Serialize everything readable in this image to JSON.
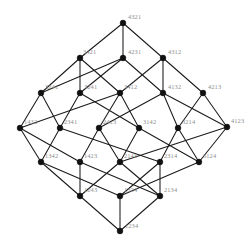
{
  "figure": {
    "type": "hasse-diagram",
    "background_color": "#ffffff",
    "node_color": "#111111",
    "edge_color": "#1a1a1a",
    "label_color": "#8d8d8d"
  },
  "nodes": [
    {
      "id": "n0",
      "label": "4321",
      "x": 123,
      "y": 23,
      "rank": 0,
      "label_dx": 5,
      "label_dy": -5
    },
    {
      "id": "n1",
      "label": "3421",
      "x": 80,
      "y": 58,
      "rank": 1,
      "label_dx": 3,
      "label_dy": -5
    },
    {
      "id": "n2",
      "label": "4231",
      "x": 123,
      "y": 58,
      "rank": 1,
      "label_dx": 5,
      "label_dy": -5
    },
    {
      "id": "n3",
      "label": "4312",
      "x": 163,
      "y": 58,
      "rank": 1,
      "label_dx": 5,
      "label_dy": -5
    },
    {
      "id": "n4",
      "label": "3241",
      "x": 41,
      "y": 93,
      "rank": 2,
      "label_dx": 4,
      "label_dy": -5
    },
    {
      "id": "n5",
      "label": "3241",
      "x": 80,
      "y": 93,
      "rank": 2,
      "label_dx": 4,
      "label_dy": -5
    },
    {
      "id": "n6",
      "label": "3412",
      "x": 120,
      "y": 93,
      "rank": 2,
      "label_dx": 4,
      "label_dy": -5
    },
    {
      "id": "n7",
      "label": "4132",
      "x": 163,
      "y": 93,
      "rank": 2,
      "label_dx": 5,
      "label_dy": -5
    },
    {
      "id": "n8",
      "label": "4213",
      "x": 203,
      "y": 93,
      "rank": 2,
      "label_dx": 5,
      "label_dy": -5
    },
    {
      "id": "n9",
      "label": "1432",
      "x": 20,
      "y": 128,
      "rank": 3,
      "label_dx": 4,
      "label_dy": -5
    },
    {
      "id": "n10",
      "label": "2341",
      "x": 60,
      "y": 128,
      "rank": 3,
      "label_dx": 4,
      "label_dy": -5
    },
    {
      "id": "n11",
      "label": "2413",
      "x": 99,
      "y": 128,
      "rank": 3,
      "label_dx": 4,
      "label_dy": -5
    },
    {
      "id": "n12",
      "label": "3142",
      "x": 139,
      "y": 128,
      "rank": 3,
      "label_dx": 4,
      "label_dy": -5
    },
    {
      "id": "n13",
      "label": "3214",
      "x": 178,
      "y": 128,
      "rank": 3,
      "label_dx": 4,
      "label_dy": -5
    },
    {
      "id": "n14",
      "label": "4123",
      "x": 227,
      "y": 127,
      "rank": 3,
      "label_dx": 4,
      "label_dy": -5
    },
    {
      "id": "n15",
      "label": "1342",
      "x": 41,
      "y": 162,
      "rank": 4,
      "label_dx": 4,
      "label_dy": -5
    },
    {
      "id": "n16",
      "label": "1423",
      "x": 80,
      "y": 162,
      "rank": 4,
      "label_dx": 4,
      "label_dy": -5
    },
    {
      "id": "n17",
      "label": "2143",
      "x": 120,
      "y": 162,
      "rank": 4,
      "label_dx": 4,
      "label_dy": -5
    },
    {
      "id": "n18",
      "label": "2314",
      "x": 160,
      "y": 162,
      "rank": 4,
      "label_dx": 4,
      "label_dy": -5
    },
    {
      "id": "n19",
      "label": "3124",
      "x": 199,
      "y": 162,
      "rank": 4,
      "label_dx": 4,
      "label_dy": -5
    },
    {
      "id": "n20",
      "label": "1243",
      "x": 80,
      "y": 196,
      "rank": 5,
      "label_dx": 4,
      "label_dy": -5
    },
    {
      "id": "n21",
      "label": "1324",
      "x": 120,
      "y": 196,
      "rank": 5,
      "label_dx": 4,
      "label_dy": -5
    },
    {
      "id": "n22",
      "label": "2134",
      "x": 160,
      "y": 196,
      "rank": 5,
      "label_dx": 4,
      "label_dy": -5
    },
    {
      "id": "n23",
      "label": "1234",
      "x": 120,
      "y": 231,
      "rank": 6,
      "label_dx": 5,
      "label_dy": -4
    }
  ],
  "edges": [
    {
      "from": "n0",
      "to": "n1"
    },
    {
      "from": "n0",
      "to": "n2"
    },
    {
      "from": "n0",
      "to": "n3"
    },
    {
      "from": "n1",
      "to": "n4"
    },
    {
      "from": "n1",
      "to": "n5"
    },
    {
      "from": "n1",
      "to": "n6"
    },
    {
      "from": "n2",
      "to": "n5"
    },
    {
      "from": "n2",
      "to": "n7"
    },
    {
      "from": "n2",
      "to": "n4"
    },
    {
      "from": "n3",
      "to": "n6"
    },
    {
      "from": "n3",
      "to": "n7"
    },
    {
      "from": "n3",
      "to": "n8"
    },
    {
      "from": "n4",
      "to": "n9"
    },
    {
      "from": "n4",
      "to": "n10"
    },
    {
      "from": "n5",
      "to": "n10"
    },
    {
      "from": "n5",
      "to": "n12"
    },
    {
      "from": "n6",
      "to": "n9"
    },
    {
      "from": "n6",
      "to": "n11"
    },
    {
      "from": "n6",
      "to": "n12"
    },
    {
      "from": "n7",
      "to": "n11"
    },
    {
      "from": "n7",
      "to": "n13"
    },
    {
      "from": "n7",
      "to": "n14"
    },
    {
      "from": "n8",
      "to": "n13"
    },
    {
      "from": "n8",
      "to": "n14"
    },
    {
      "from": "n9",
      "to": "n15"
    },
    {
      "from": "n9",
      "to": "n16"
    },
    {
      "from": "n10",
      "to": "n15"
    },
    {
      "from": "n10",
      "to": "n18"
    },
    {
      "from": "n11",
      "to": "n16"
    },
    {
      "from": "n11",
      "to": "n17"
    },
    {
      "from": "n12",
      "to": "n17"
    },
    {
      "from": "n12",
      "to": "n19"
    },
    {
      "from": "n13",
      "to": "n18"
    },
    {
      "from": "n13",
      "to": "n19"
    },
    {
      "from": "n14",
      "to": "n17"
    },
    {
      "from": "n14",
      "to": "n19"
    },
    {
      "from": "n15",
      "to": "n20"
    },
    {
      "from": "n15",
      "to": "n21"
    },
    {
      "from": "n16",
      "to": "n20"
    },
    {
      "from": "n16",
      "to": "n22"
    },
    {
      "from": "n17",
      "to": "n20"
    },
    {
      "from": "n17",
      "to": "n22"
    },
    {
      "from": "n18",
      "to": "n21"
    },
    {
      "from": "n18",
      "to": "n22"
    },
    {
      "from": "n19",
      "to": "n21"
    },
    {
      "from": "n20",
      "to": "n23"
    },
    {
      "from": "n21",
      "to": "n23"
    },
    {
      "from": "n22",
      "to": "n23"
    }
  ]
}
